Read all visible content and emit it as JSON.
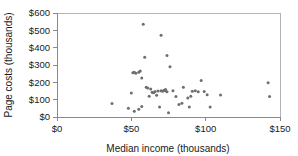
{
  "chart_data": {
    "type": "scatter",
    "title": "",
    "xlabel": "Median income (thousands)",
    "ylabel": "Page costs (thousands)",
    "xlim": [
      0,
      150
    ],
    "ylim": [
      0,
      600
    ],
    "grid": false,
    "legend": "none",
    "marker_color": "#6e6e6e",
    "xticks": [
      "$0",
      "$50",
      "$100",
      "$150"
    ],
    "xtick_values": [
      0,
      50,
      100,
      150
    ],
    "yticks": [
      "$0",
      "$100",
      "$200",
      "$300",
      "$400",
      "$500",
      "$600"
    ],
    "ytick_values": [
      0,
      100,
      200,
      300,
      400,
      500,
      600
    ],
    "points": [
      {
        "x": 37,
        "y": 78
      },
      {
        "x": 48,
        "y": 50
      },
      {
        "x": 50,
        "y": 138
      },
      {
        "x": 51,
        "y": 255
      },
      {
        "x": 52,
        "y": 258
      },
      {
        "x": 52,
        "y": 33
      },
      {
        "x": 53,
        "y": 253
      },
      {
        "x": 55,
        "y": 258
      },
      {
        "x": 55,
        "y": 45
      },
      {
        "x": 56,
        "y": 265
      },
      {
        "x": 57,
        "y": 225
      },
      {
        "x": 57,
        "y": 60
      },
      {
        "x": 58,
        "y": 535
      },
      {
        "x": 59,
        "y": 345
      },
      {
        "x": 60,
        "y": 172
      },
      {
        "x": 61,
        "y": 168
      },
      {
        "x": 62,
        "y": 120
      },
      {
        "x": 63,
        "y": 162
      },
      {
        "x": 64,
        "y": 143
      },
      {
        "x": 65,
        "y": 140
      },
      {
        "x": 66,
        "y": 147
      },
      {
        "x": 67,
        "y": 125
      },
      {
        "x": 68,
        "y": 150
      },
      {
        "x": 69,
        "y": 58
      },
      {
        "x": 70,
        "y": 472
      },
      {
        "x": 70,
        "y": 152
      },
      {
        "x": 71,
        "y": 148
      },
      {
        "x": 72,
        "y": 155
      },
      {
        "x": 73,
        "y": 158
      },
      {
        "x": 73,
        "y": 152
      },
      {
        "x": 74,
        "y": 355
      },
      {
        "x": 74,
        "y": 145
      },
      {
        "x": 75,
        "y": 25
      },
      {
        "x": 76,
        "y": 290
      },
      {
        "x": 78,
        "y": 152
      },
      {
        "x": 80,
        "y": 118
      },
      {
        "x": 82,
        "y": 72
      },
      {
        "x": 84,
        "y": 80
      },
      {
        "x": 85,
        "y": 172
      },
      {
        "x": 88,
        "y": 110
      },
      {
        "x": 89,
        "y": 57
      },
      {
        "x": 90,
        "y": 120
      },
      {
        "x": 91,
        "y": 148
      },
      {
        "x": 93,
        "y": 152
      },
      {
        "x": 95,
        "y": 145
      },
      {
        "x": 97,
        "y": 210
      },
      {
        "x": 99,
        "y": 147
      },
      {
        "x": 101,
        "y": 128
      },
      {
        "x": 103,
        "y": 58
      },
      {
        "x": 110,
        "y": 127
      },
      {
        "x": 142,
        "y": 197
      },
      {
        "x": 143,
        "y": 118
      }
    ]
  }
}
